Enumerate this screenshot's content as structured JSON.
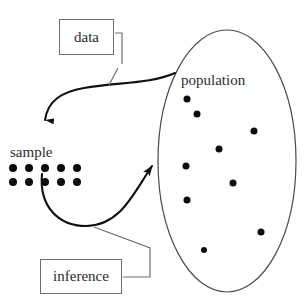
{
  "diagram": {
    "canvas": {
      "width": 304,
      "height": 307,
      "background": "#ffffff"
    },
    "ink_color": "#1a1a1a",
    "box_stroke_color": "#6f6f6f",
    "dot_color": "#0d0d0d",
    "boxes": [
      {
        "id": "data",
        "label": "data",
        "x": 59,
        "y": 19,
        "width": 55,
        "height": 36
      },
      {
        "id": "inference",
        "label": "inference",
        "x": 40,
        "y": 259,
        "width": 82,
        "height": 35
      }
    ],
    "labels": [
      {
        "id": "population",
        "text": "population",
        "x": 181,
        "y": 73
      },
      {
        "id": "sample",
        "text": "sample",
        "x": 10,
        "y": 145
      }
    ],
    "sample_dots": {
      "rows": 2,
      "per_row": 5,
      "total": 10,
      "dot_diameter": 8,
      "origin": {
        "x": 9,
        "y": 164
      }
    },
    "population_dots": {
      "count": 9,
      "points": [
        {
          "cx": 187,
          "cy": 99,
          "r": 3.5
        },
        {
          "cx": 197,
          "cy": 114,
          "r": 3.5
        },
        {
          "cx": 254,
          "cy": 131,
          "r": 3.5
        },
        {
          "cx": 219,
          "cy": 149,
          "r": 3.5
        },
        {
          "cx": 186,
          "cy": 166,
          "r": 3.5
        },
        {
          "cx": 233,
          "cy": 183,
          "r": 3.5
        },
        {
          "cx": 187,
          "cy": 200,
          "r": 3.5
        },
        {
          "cx": 261,
          "cy": 232,
          "r": 3.5
        },
        {
          "cx": 204,
          "cy": 250,
          "r": 3.0
        }
      ]
    },
    "population_ellipse": {
      "cx": 227,
      "cy": 161,
      "rx": 69,
      "ry": 131
    },
    "arrows": [
      {
        "id": "population-to-sample",
        "from": "population",
        "to": "sample",
        "description": "curved arrow sweeping left from population ellipse down to the sample dots",
        "path": "M 175 73 C 150 84 118 82 84 88 C 62 92 48 100 45 118",
        "arrowhead": {
          "x": 45,
          "y": 136,
          "direction": "down"
        }
      },
      {
        "id": "sample-to-population",
        "from": "sample",
        "to": "population",
        "description": "curved arrow sweeping right from the sample dots into the population ellipse",
        "path": "M 42 174 C 40 205 58 226 86 226 C 120 226 132 196 156 163",
        "arrowhead": {
          "x": 159,
          "y": 160,
          "direction": "up-right"
        }
      }
    ],
    "leader_lines": [
      {
        "id": "data-leader",
        "from_box": "data",
        "description": "bracket leader from the data box right edge down to the upper curved arrow",
        "path": "M 114 52 L 121 52 L 121 33 M 121 52 L 121 63 M 118 66 L 110 84"
      },
      {
        "id": "inference-leader",
        "from_box": "inference",
        "description": "elbow leader from the inference box right edge up to the lower curved arrow",
        "path": "M 122 277 L 150 277 L 150 248 L 95 227"
      }
    ]
  }
}
